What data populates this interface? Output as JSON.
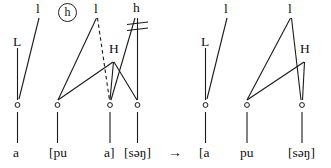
{
  "figure": {
    "type": "autosegmental-tone-association-diagram",
    "derivation_arrow": "→",
    "circled_annotation": "h",
    "delink_mark": "≠",
    "left_panel": {
      "name": "input-representation",
      "tone_tier": [
        {
          "id": "L1",
          "label": "L",
          "x": 17,
          "y": 41
        },
        {
          "id": "l1",
          "label": "l",
          "x": 38,
          "y": 4
        },
        {
          "id": "l2",
          "label": "l",
          "x": 96,
          "y": 4
        },
        {
          "id": "H1",
          "label": "H",
          "x": 113,
          "y": 48
        },
        {
          "id": "h1",
          "label": "h",
          "x": 134,
          "y": 3
        }
      ],
      "skeleton_slots": [
        {
          "id": "x1",
          "x": 17,
          "y": 105
        },
        {
          "id": "x2",
          "x": 57,
          "y": 105
        },
        {
          "id": "x3",
          "x": 110,
          "y": 105
        },
        {
          "id": "x4",
          "x": 137,
          "y": 105
        }
      ],
      "segment_tier": [
        {
          "id": "s1",
          "label": "a",
          "x": 17,
          "y": 153
        },
        {
          "id": "s2",
          "label": "[pu",
          "x": 57,
          "y": 153
        },
        {
          "id": "s3",
          "label": "a]",
          "x": 110,
          "y": 153
        },
        {
          "id": "s4",
          "label": "[səŋ]",
          "x": 139,
          "y": 153
        }
      ]
    },
    "right_panel": {
      "name": "output-representation",
      "tone_tier": [
        {
          "id": "L1",
          "label": "L",
          "x": 205,
          "y": 41
        },
        {
          "id": "l1",
          "label": "l",
          "x": 226,
          "y": 4
        },
        {
          "id": "l2",
          "label": "l",
          "x": 290,
          "y": 4
        },
        {
          "id": "H1",
          "label": "H",
          "x": 304,
          "y": 48
        }
      ],
      "skeleton_slots": [
        {
          "id": "x1",
          "x": 205,
          "y": 105
        },
        {
          "id": "x2",
          "x": 247,
          "y": 105
        },
        {
          "id": "x3",
          "x": 302,
          "y": 105
        }
      ],
      "segment_tier": [
        {
          "id": "s1",
          "label": "[a",
          "x": 205,
          "y": 153
        },
        {
          "id": "s2",
          "label": "pu",
          "x": 247,
          "y": 153
        },
        {
          "id": "s3",
          "label": "[səŋ]",
          "x": 303,
          "y": 153
        }
      ]
    },
    "colors": {
      "ink": "#1a1a1a",
      "background": "#ffffff"
    }
  }
}
